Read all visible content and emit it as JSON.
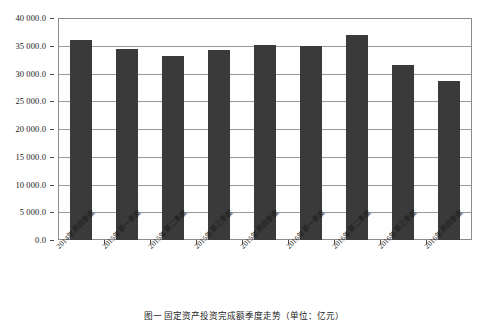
{
  "chart_data": {
    "type": "bar",
    "title": "",
    "xlabel": "",
    "ylabel": "",
    "ylim": [
      0,
      40000
    ],
    "ytick_step": 5000,
    "grid": true,
    "legend": null,
    "bar_color": "#3a3a3a",
    "categories": [
      "2014年第四季度",
      "2015年第一季度",
      "2015年第二季度",
      "2015年第三季度",
      "2015年第四季度",
      "2016年第一季度",
      "2016年第二季度",
      "2016年第三季度",
      "2016年第四季度"
    ],
    "values": [
      36000,
      34500,
      33100,
      34300,
      35200,
      34900,
      36900,
      31500,
      28600
    ],
    "ytick_labels": [
      "0.0",
      "5 000.0",
      "10 000.0",
      "15 000.0",
      "20 000.0",
      "25 000.0",
      "30 000.0",
      "35 000.0",
      "40 000.0"
    ],
    "ytick_values": [
      0,
      5000,
      10000,
      15000,
      20000,
      25000,
      30000,
      35000,
      40000
    ]
  },
  "caption": {
    "text": "图一  固定资产投资完成额季度走势（单位：亿元）"
  }
}
